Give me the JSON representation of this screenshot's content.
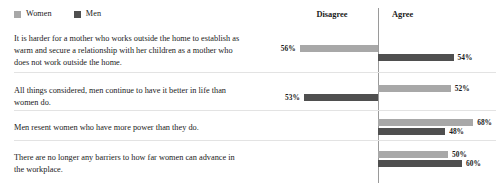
{
  "legend": {
    "items": [
      {
        "label": "Women",
        "color": "#a8a8a8",
        "icon": "square-swatch-icon"
      },
      {
        "label": "Men",
        "color": "#4f4f4f",
        "icon": "square-swatch-icon"
      }
    ]
  },
  "header": {
    "disagree": "Disagree",
    "agree": "Agree"
  },
  "chart_data": {
    "type": "bar",
    "title": "",
    "subtitle": "",
    "xlabel": "",
    "ylabel": "",
    "orientation": "horizontal",
    "layout": "diverging-paired",
    "grid": false,
    "legend_position": "top-left",
    "axis_sides": [
      "Disagree",
      "Agree"
    ],
    "center_divider_label_left": "Disagree",
    "center_divider_label_right": "Agree",
    "value_suffix": "%",
    "colors": {
      "Women": "#a8a8a8",
      "Men": "#4f4f4f"
    },
    "categories": [
      "It is harder for a mother who works outside the home to establish as warm and secure a relationship with her children as a mother who does not work outside the home.",
      "All things considered, men continue to have it better in life than women do.",
      "Men resent women who have more power than they do.",
      "There are no longer any barriers to how far women can advance in the workplace."
    ],
    "series": [
      {
        "name": "Women",
        "values": [
          56,
          52,
          68,
          50
        ],
        "sides": [
          "Disagree",
          "Agree",
          "Agree",
          "Agree"
        ],
        "labels": [
          "56%",
          "52%",
          "68%",
          "50%"
        ]
      },
      {
        "name": "Men",
        "values": [
          54,
          53,
          48,
          60
        ],
        "sides": [
          "Agree",
          "Disagree",
          "Agree",
          "Agree"
        ],
        "labels": [
          "54%",
          "53%",
          "48%",
          "60%"
        ]
      }
    ]
  },
  "rows": [
    {
      "statement": "It is harder for a mother who works outside the home to establish as warm and secure a relationship with her children as a mother who does not work outside the home.",
      "women": {
        "label": "56%",
        "value": 56,
        "side": "Disagree"
      },
      "men": {
        "label": "54%",
        "value": 54,
        "side": "Agree"
      }
    },
    {
      "statement": "All things considered, men continue to have it better in life than women do.",
      "women": {
        "label": "52%",
        "value": 52,
        "side": "Agree"
      },
      "men": {
        "label": "53%",
        "value": 53,
        "side": "Disagree"
      }
    },
    {
      "statement": "Men resent women who have more power than they do.",
      "women": {
        "label": "68%",
        "value": 68,
        "side": "Agree"
      },
      "men": {
        "label": "48%",
        "value": 48,
        "side": "Agree"
      }
    },
    {
      "statement": "There are no longer any barriers to how far women can advance in the workplace.",
      "women": {
        "label": "50%",
        "value": 50,
        "side": "Agree"
      },
      "men": {
        "label": "60%",
        "value": 60,
        "side": "Agree"
      }
    }
  ]
}
